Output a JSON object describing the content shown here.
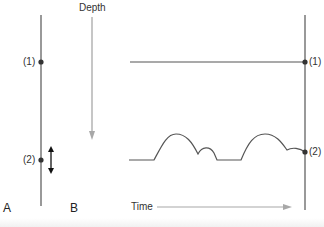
{
  "diagram": {
    "panel_labels": {
      "a": "A",
      "b": "B"
    },
    "depth_axis_label": "Depth",
    "time_axis_label": "Time",
    "points": [
      {
        "id": 1,
        "label": "(1)"
      },
      {
        "id": 2,
        "label": "(2)"
      }
    ],
    "right_points": [
      {
        "id": 1,
        "label": "(1)"
      },
      {
        "id": 2,
        "label": "(2)"
      }
    ],
    "colors": {
      "line": "#555555",
      "arrow": "#a8a8a8",
      "dot": "#333333",
      "text": "#333333"
    }
  }
}
